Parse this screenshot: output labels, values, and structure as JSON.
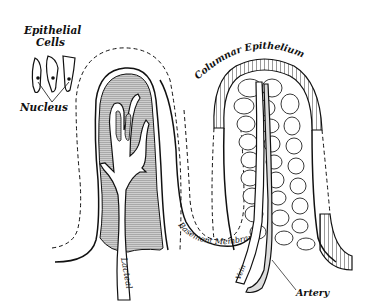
{
  "figure": {
    "labels": {
      "epithelial_cells_line1": "Epithelial",
      "epithelial_cells_line2": "Cells",
      "nucleus": "Nucleus",
      "columnar_epithelium": "Columnar Epithelium",
      "lacteal": "Lacteal",
      "basement_membrane": "Basement Membrane",
      "vein": "Vein",
      "artery": "Artery"
    },
    "colors": {
      "ink": "#111111",
      "paper": "#ffffff",
      "hatch": "#8a8a8a"
    }
  }
}
